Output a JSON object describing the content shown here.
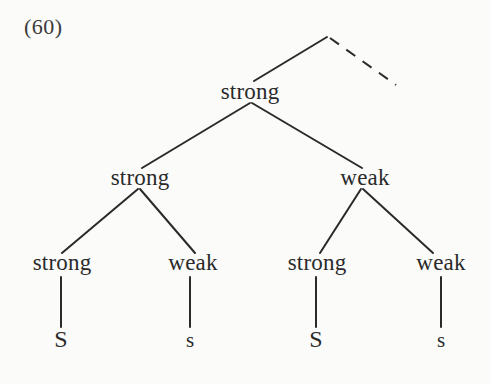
{
  "figure": {
    "example_number": "(60)",
    "width": 491,
    "height": 384,
    "background_color": "#fbfbfa",
    "ink_color": "#2a2a2a"
  },
  "chart_data": {
    "type": "diagram",
    "diagram_kind": "metrical-grid-tree",
    "title": "(60)",
    "nodes": [
      {
        "id": "root",
        "label": "",
        "x": 327,
        "y": 37,
        "level": 0,
        "visible_label": false
      },
      {
        "id": "n1",
        "label": "strong",
        "x": 250,
        "y": 103,
        "level": 1,
        "visible_label": true
      },
      {
        "id": "n2",
        "label": "strong",
        "x": 140,
        "y": 189,
        "level": 2,
        "visible_label": true
      },
      {
        "id": "n3",
        "label": "weak",
        "x": 365,
        "y": 189,
        "level": 2,
        "visible_label": true
      },
      {
        "id": "n4",
        "label": "strong",
        "x": 62,
        "y": 274,
        "level": 3,
        "visible_label": true
      },
      {
        "id": "n5",
        "label": "weak",
        "x": 193,
        "y": 274,
        "level": 3,
        "visible_label": true
      },
      {
        "id": "n6",
        "label": "strong",
        "x": 317,
        "y": 274,
        "level": 3,
        "visible_label": true
      },
      {
        "id": "n7",
        "label": "weak",
        "x": 441,
        "y": 274,
        "level": 3,
        "visible_label": true
      },
      {
        "id": "leaf1",
        "label": "S",
        "x": 61,
        "y": 351,
        "level": 4,
        "visible_label": true,
        "case": "upper"
      },
      {
        "id": "leaf2",
        "label": "s",
        "x": 190,
        "y": 351,
        "level": 4,
        "visible_label": true,
        "case": "lower"
      },
      {
        "id": "leaf3",
        "label": "S",
        "x": 316,
        "y": 351,
        "level": 4,
        "visible_label": true,
        "case": "upper"
      },
      {
        "id": "leaf4",
        "label": "s",
        "x": 441,
        "y": 351,
        "level": 4,
        "visible_label": true,
        "case": "lower"
      }
    ],
    "edges": [
      {
        "from": "root",
        "to": "n1",
        "style": "solid",
        "x1": 327,
        "y1": 37,
        "x2": 254,
        "y2": 81
      },
      {
        "from": "root",
        "to": "unspecified",
        "style": "dashed",
        "x1": 330,
        "y1": 38,
        "x2": 396,
        "y2": 85
      },
      {
        "from": "n1",
        "to": "n2",
        "style": "solid",
        "x1": 250,
        "y1": 103,
        "x2": 142,
        "y2": 168
      },
      {
        "from": "n1",
        "to": "n3",
        "style": "solid",
        "x1": 252,
        "y1": 103,
        "x2": 362,
        "y2": 168
      },
      {
        "from": "n2",
        "to": "n4",
        "style": "solid",
        "x1": 138,
        "y1": 189,
        "x2": 62,
        "y2": 253
      },
      {
        "from": "n2",
        "to": "n5",
        "style": "solid",
        "x1": 140,
        "y1": 189,
        "x2": 195,
        "y2": 253
      },
      {
        "from": "n3",
        "to": "n6",
        "style": "solid",
        "x1": 361,
        "y1": 189,
        "x2": 320,
        "y2": 253
      },
      {
        "from": "n3",
        "to": "n7",
        "style": "solid",
        "x1": 363,
        "y1": 189,
        "x2": 433,
        "y2": 253
      },
      {
        "from": "n4",
        "to": "leaf1",
        "style": "solid",
        "x1": 61,
        "y1": 277,
        "x2": 61,
        "y2": 327
      },
      {
        "from": "n5",
        "to": "leaf2",
        "style": "solid",
        "x1": 190,
        "y1": 277,
        "x2": 190,
        "y2": 327
      },
      {
        "from": "n6",
        "to": "leaf3",
        "style": "solid",
        "x1": 316,
        "y1": 277,
        "x2": 316,
        "y2": 327
      },
      {
        "from": "n7",
        "to": "leaf4",
        "style": "solid",
        "x1": 441,
        "y1": 277,
        "x2": 441,
        "y2": 327
      }
    ],
    "labels": {
      "level1": [
        "strong"
      ],
      "level2": [
        "strong",
        "weak"
      ],
      "level3": [
        "strong",
        "weak",
        "strong",
        "weak"
      ],
      "terminals": [
        "S",
        "s",
        "S",
        "s"
      ]
    }
  }
}
